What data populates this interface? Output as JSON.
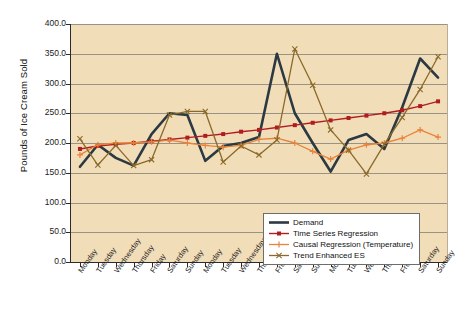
{
  "chart_data": {
    "type": "line",
    "title": "",
    "xlabel": "",
    "ylabel": "Pounds of Ice Cream Sold",
    "ylim": [
      0,
      400
    ],
    "ytick_step": 50,
    "yticks": [
      "400.0",
      "350.0",
      "300.0",
      "250.0",
      "200.0",
      "150.0",
      "100.0",
      "50.0",
      "0.0"
    ],
    "grid": true,
    "legend_position": "inside-bottom-right",
    "plot_background": "#f2ddb9",
    "categories": [
      "Monday",
      "Tuesday",
      "Wednesday",
      "Thursday",
      "Friday",
      "Saturday",
      "Sunday",
      "Monday",
      "Tuesday",
      "Wednesday",
      "Thursday",
      "Friday",
      "Saturday",
      "Sunday",
      "Monday",
      "Tuesday",
      "Wednesday",
      "Thursday",
      "Friday",
      "Saturday",
      "Sunday"
    ],
    "series": [
      {
        "name": "Demand",
        "color": "#2b3a42",
        "marker": "none",
        "width": 2.6,
        "values": [
          160,
          197,
          175,
          162,
          215,
          250,
          247,
          170,
          195,
          200,
          210,
          350,
          250,
          200,
          152,
          205,
          215,
          190,
          260,
          342,
          310
        ]
      },
      {
        "name": "Time Series Regression",
        "color": "#b01c20",
        "marker": "square",
        "width": 1.4,
        "values": [
          190,
          195,
          198,
          200,
          203,
          206,
          209,
          212,
          215,
          219,
          222,
          226,
          230,
          234,
          238,
          242,
          246,
          250,
          255,
          262,
          270
        ]
      },
      {
        "name": "Causal Regression (Temperature)",
        "color": "#e8833a",
        "marker": "plus",
        "width": 1.3,
        "values": [
          180,
          197,
          200,
          200,
          202,
          205,
          200,
          196,
          193,
          196,
          206,
          208,
          200,
          186,
          173,
          188,
          197,
          200,
          208,
          222,
          210
        ]
      },
      {
        "name": "Trend Enhanced ES",
        "color": "#8a6a2a",
        "marker": "x",
        "width": 1.3,
        "values": [
          207,
          163,
          196,
          162,
          172,
          247,
          253,
          253,
          168,
          195,
          180,
          205,
          358,
          297,
          222,
          188,
          148,
          198,
          243,
          290,
          345
        ]
      }
    ]
  }
}
